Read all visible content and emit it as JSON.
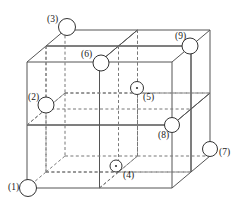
{
  "figure": {
    "title": "",
    "type": "cube-octant-diagram",
    "stroke_color": "#555555",
    "dashed_color": "#777777",
    "marker_stroke": "#333333",
    "background": "#ffffff"
  },
  "geometry": {
    "front_face": {
      "x0": 27,
      "y0": 62,
      "x1": 172,
      "y1": 188
    },
    "depth_offset": {
      "dx": 38,
      "dy": -32
    },
    "subdivisions": 2
  },
  "markers": [
    {
      "id": "1",
      "label": "(1)",
      "cx": 28,
      "cy": 188,
      "r": 8.5,
      "dot": false,
      "label_x": 8,
      "label_y": 183
    },
    {
      "id": "2",
      "label": "(2)",
      "cx": 46,
      "cy": 105,
      "r": 8.0,
      "dot": false,
      "label_x": 28,
      "label_y": 93
    },
    {
      "id": "3",
      "label": "(3)",
      "cx": 67,
      "cy": 27,
      "r": 8.5,
      "dot": false,
      "label_x": 47,
      "label_y": 15
    },
    {
      "id": "4",
      "label": "(4)",
      "cx": 116,
      "cy": 166,
      "r": 6.0,
      "dot": true,
      "label_x": 123,
      "label_y": 171
    },
    {
      "id": "5",
      "label": "(5)",
      "cx": 137,
      "cy": 88,
      "r": 6.5,
      "dot": true,
      "label_x": 143,
      "label_y": 93
    },
    {
      "id": "6",
      "label": "(6)",
      "cx": 101,
      "cy": 63,
      "r": 8.0,
      "dot": false,
      "label_x": 81,
      "label_y": 50
    },
    {
      "id": "7",
      "label": "(7)",
      "cx": 210,
      "cy": 149,
      "r": 7.5,
      "dot": false,
      "label_x": 219,
      "label_y": 148
    },
    {
      "id": "8",
      "label": "(8)",
      "cx": 172,
      "cy": 125,
      "r": 7.5,
      "dot": false,
      "label_x": 158,
      "label_y": 131
    },
    {
      "id": "9",
      "label": "(9)",
      "cx": 190,
      "cy": 46,
      "r": 8.0,
      "dot": false,
      "label_x": 175,
      "label_y": 32
    }
  ]
}
